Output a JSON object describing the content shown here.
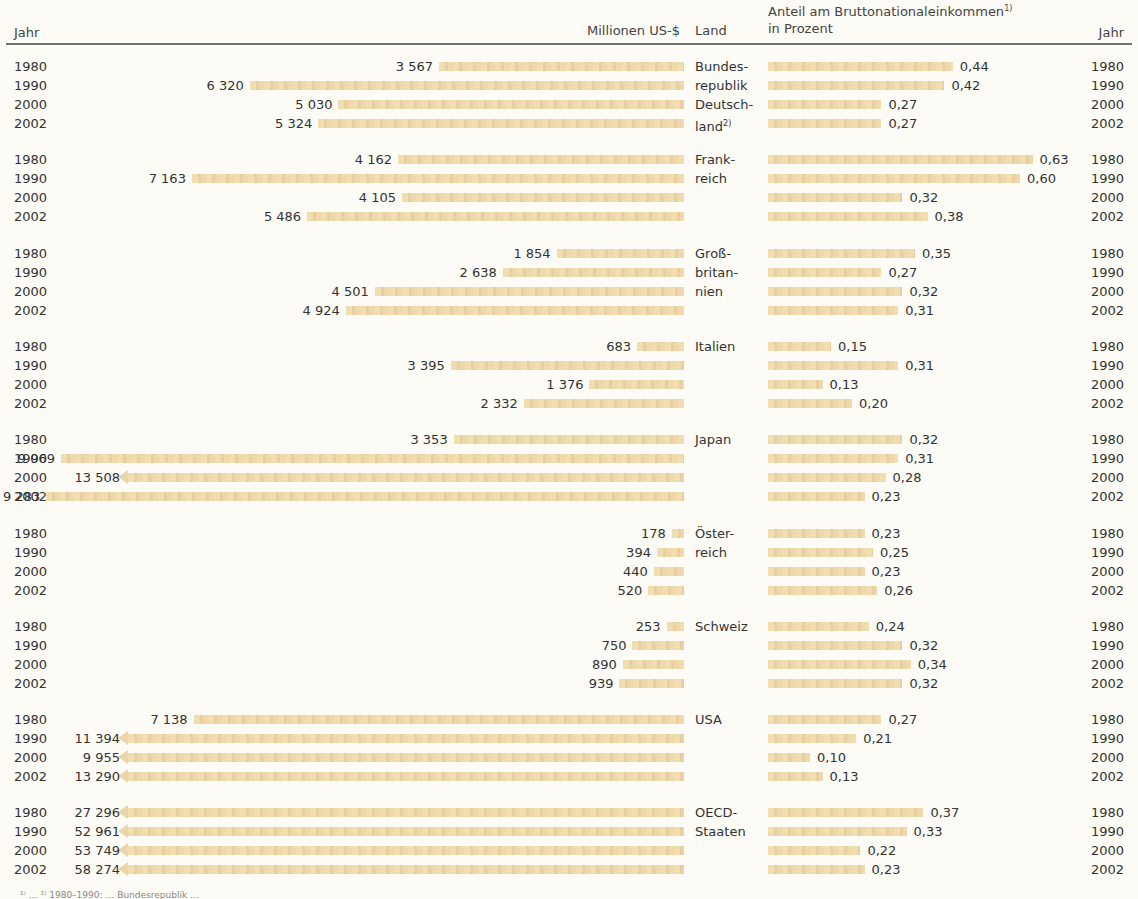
{
  "header": {
    "year_left": "Jahr",
    "amount": "Millionen US-$",
    "country": "Land",
    "share_line1": "Anteil am Bruttonationaleinkommen",
    "share_sup": "1)",
    "share_line2": "in Prozent",
    "year_right": "Jahr"
  },
  "footnote": "¹⁾ … ²⁾ 1980–1990: … Bundesrepublik …",
  "chart_data": {
    "type": "bar",
    "years": [
      "1980",
      "1990",
      "2000",
      "2002"
    ],
    "countries": [
      {
        "name": "Bundesrepublik Deutschland",
        "label_lines": [
          "Bundes-",
          "republik",
          "Deutsch-",
          "land"
        ],
        "sup": "2)",
        "usd": [
          3567,
          6320,
          5030,
          5324
        ],
        "usd_text": [
          "3 567",
          "6 320",
          "5 030",
          "5 324"
        ],
        "pct": [
          0.44,
          0.42,
          0.27,
          0.27
        ],
        "pct_text": [
          "0,44",
          "0,42",
          "0,27",
          "0,27"
        ]
      },
      {
        "name": "Frankreich",
        "label_lines": [
          "Frank-",
          "reich"
        ],
        "usd": [
          4162,
          7163,
          4105,
          5486
        ],
        "usd_text": [
          "4 162",
          "7 163",
          "4 105",
          "5 486"
        ],
        "pct": [
          0.63,
          0.6,
          0.32,
          0.38
        ],
        "pct_text": [
          "0,63",
          "0,60",
          "0,32",
          "0,38"
        ]
      },
      {
        "name": "Großbritannien",
        "label_lines": [
          "Groß-",
          "britan-",
          "nien"
        ],
        "usd": [
          1854,
          2638,
          4501,
          4924
        ],
        "usd_text": [
          "1 854",
          "2 638",
          "4 501",
          "4 924"
        ],
        "pct": [
          0.35,
          0.27,
          0.32,
          0.31
        ],
        "pct_text": [
          "0,35",
          "0,27",
          "0,32",
          "0,31"
        ]
      },
      {
        "name": "Italien",
        "label_lines": [
          "Italien"
        ],
        "usd": [
          683,
          3395,
          1376,
          2332
        ],
        "usd_text": [
          "683",
          "3 395",
          "1 376",
          "2 332"
        ],
        "pct": [
          0.15,
          0.31,
          0.13,
          0.2
        ],
        "pct_text": [
          "0,15",
          "0,31",
          "0,13",
          "0,20"
        ]
      },
      {
        "name": "Japan",
        "label_lines": [
          "Japan"
        ],
        "usd": [
          3353,
          9069,
          13508,
          9283
        ],
        "usd_text": [
          "3 353",
          "9 069",
          "13 508",
          "9 283"
        ],
        "pct": [
          0.32,
          0.31,
          0.28,
          0.23
        ],
        "pct_text": [
          "0,32",
          "0,31",
          "0,28",
          "0,23"
        ]
      },
      {
        "name": "Österreich",
        "label_lines": [
          "Öster-",
          "reich"
        ],
        "usd": [
          178,
          394,
          440,
          520
        ],
        "usd_text": [
          "178",
          "394",
          "440",
          "520"
        ],
        "pct": [
          0.23,
          0.25,
          0.23,
          0.26
        ],
        "pct_text": [
          "0,23",
          "0,25",
          "0,23",
          "0,26"
        ]
      },
      {
        "name": "Schweiz",
        "label_lines": [
          "Schweiz"
        ],
        "usd": [
          253,
          750,
          890,
          939
        ],
        "usd_text": [
          "253",
          "750",
          "890",
          "939"
        ],
        "pct": [
          0.24,
          0.32,
          0.34,
          0.32
        ],
        "pct_text": [
          "0,24",
          "0,32",
          "0,34",
          "0,32"
        ]
      },
      {
        "name": "USA",
        "label_lines": [
          "USA"
        ],
        "usd": [
          7138,
          11394,
          9955,
          13290
        ],
        "usd_text": [
          "7 138",
          "11 394",
          "9 955",
          "13 290"
        ],
        "pct": [
          0.27,
          0.21,
          0.1,
          0.13
        ],
        "pct_text": [
          "0,27",
          "0,21",
          "0,10",
          "0,13"
        ]
      },
      {
        "name": "OECD-Staaten",
        "label_lines": [
          "OECD-",
          "Staaten"
        ],
        "usd": [
          27296,
          52961,
          53749,
          58274
        ],
        "usd_text": [
          "27 296",
          "52 961",
          "53 749",
          "58 274"
        ],
        "pct": [
          0.37,
          0.33,
          0.22,
          0.23
        ],
        "pct_text": [
          "0,37",
          "0,33",
          "0,22",
          "0,23"
        ]
      }
    ],
    "colors": {
      "bar": "#f0ddb0",
      "rule": "#6e7472",
      "background": "#fcfbf5"
    }
  }
}
